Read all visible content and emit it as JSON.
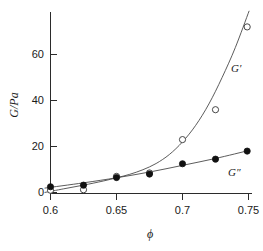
{
  "chart_data": {
    "type": "scatter",
    "title": "",
    "subtitle": "",
    "xlabel": "ϕ",
    "ylabel": "G/Pa",
    "xlim": [
      0.593,
      0.753
    ],
    "ylim": [
      -3,
      78
    ],
    "grid": false,
    "legend_position": "inline-right",
    "xticks": [
      0.6,
      0.65,
      0.7,
      0.75
    ],
    "xtick_labels": [
      "0.6",
      "0.65",
      "0.7",
      "0.75"
    ],
    "yticks": [
      0,
      20,
      40,
      60
    ],
    "ytick_labels": [
      "0",
      "20",
      "40",
      "60"
    ],
    "series": [
      {
        "name": "G′",
        "marker": "open-circle",
        "label_text": "G′",
        "x": [
          0.6,
          0.625,
          0.65,
          0.675,
          0.7,
          0.725,
          0.749
        ],
        "values": [
          1.0,
          1.2,
          7.0,
          8.5,
          23.0,
          36.0,
          72.0
        ]
      },
      {
        "name": "G″",
        "marker": "filled-circle",
        "label_text": "G″",
        "x": [
          0.6,
          0.625,
          0.65,
          0.675,
          0.7,
          0.725,
          0.749
        ],
        "values": [
          2.5,
          3.2,
          6.5,
          8.0,
          12.5,
          14.5,
          18.0
        ]
      }
    ],
    "fit_curves": [
      {
        "name": "G′-fit",
        "points_x": [
          0.5955,
          0.61,
          0.625,
          0.64,
          0.65,
          0.66,
          0.67,
          0.68,
          0.69,
          0.7,
          0.71,
          0.72,
          0.73,
          0.74,
          0.7505
        ],
        "points_y": [
          0.0,
          1.6,
          3.2,
          5.0,
          6.4,
          7.9,
          9.9,
          12.6,
          16.5,
          22.0,
          29.2,
          38.5,
          50.0,
          63.0,
          79.0
        ]
      },
      {
        "name": "G″-fit",
        "points_x": [
          0.5955,
          0.625,
          0.65,
          0.675,
          0.7,
          0.725,
          0.7505
        ],
        "points_y": [
          1.9,
          4.2,
          6.4,
          8.9,
          11.8,
          14.8,
          18.3
        ]
      }
    ]
  },
  "axes": {
    "x_axis_name": "phi-axis",
    "y_axis_name": "G-axis"
  }
}
